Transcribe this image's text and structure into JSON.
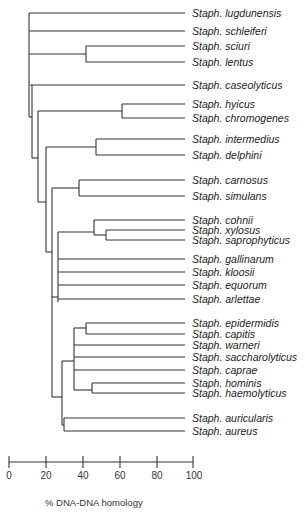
{
  "diagram": {
    "type": "dendrogram",
    "taxa": [
      {
        "label": "Staph. lugdunensis",
        "y": 13
      },
      {
        "label": "Staph. schleiferi",
        "y": 31
      },
      {
        "label": "Staph. sciuri",
        "y": 46
      },
      {
        "label": "Staph. lentus",
        "y": 62
      },
      {
        "label": "Staph. caseolyticus",
        "y": 85
      },
      {
        "label": "Staph. hyicus",
        "y": 104
      },
      {
        "label": "Staph. chromogenes",
        "y": 118
      },
      {
        "label": "Staph. intermedius",
        "y": 139
      },
      {
        "label": "Staph. delphini",
        "y": 155
      },
      {
        "label": "Staph. carnosus",
        "y": 180
      },
      {
        "label": "Staph. simulans",
        "y": 196
      },
      {
        "label": "Staph. cohnii",
        "y": 220
      },
      {
        "label": "Staph. xylosus",
        "y": 230
      },
      {
        "label": "Staph. saprophyticus",
        "y": 240
      },
      {
        "label": "Staph. gallinarum",
        "y": 259
      },
      {
        "label": "Staph. kloosii",
        "y": 272
      },
      {
        "label": "Staph. equorum",
        "y": 285
      },
      {
        "label": "Staph. arlettae",
        "y": 299
      },
      {
        "label": "Staph. epidermidis",
        "y": 323
      },
      {
        "label": "Staph. capitis",
        "y": 334
      },
      {
        "label": "Staph. warneri",
        "y": 345
      },
      {
        "label": "Staph. saccharolyticus",
        "y": 357
      },
      {
        "label": "Staph. caprae",
        "y": 370
      },
      {
        "label": "Staph. hominis",
        "y": 383
      },
      {
        "label": "Staph. haemolyticus",
        "y": 393
      },
      {
        "label": "Staph. auricularis",
        "y": 418
      },
      {
        "label": "Staph. aureus",
        "y": 431
      }
    ],
    "axis": {
      "ticks": [
        "0",
        "20",
        "40",
        "60",
        "80",
        "100"
      ],
      "title": "% DNA-DNA homology"
    }
  }
}
